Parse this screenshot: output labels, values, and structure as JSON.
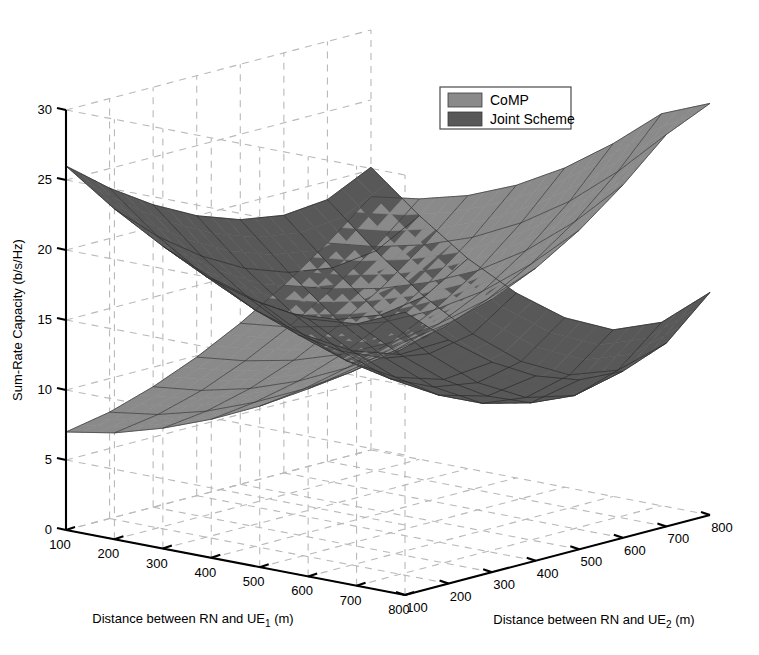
{
  "figure": {
    "width": 759,
    "height": 655,
    "background": "#ffffff"
  },
  "legend": {
    "position": "top-center-right",
    "items": [
      {
        "label": "CoMP",
        "color": "#8a8a8a"
      },
      {
        "label": "Joint Scheme",
        "color": "#585858"
      }
    ]
  },
  "axes": {
    "z": {
      "title": "Sum-Rate Capacity (b/s/Hz)",
      "ticks": [
        0,
        5,
        10,
        15,
        20,
        25,
        30
      ],
      "range": [
        0,
        30
      ]
    },
    "x": {
      "title_main": "Distance between RN and UE",
      "title_sub": "1",
      "title_unit": " (m)",
      "title_full": "Distance between RN and UE₁ (m)",
      "ticks": [
        100,
        200,
        300,
        400,
        500,
        600,
        700,
        800
      ],
      "range": [
        100,
        800
      ]
    },
    "y": {
      "title_main": "Distance between RN and UE",
      "title_sub": "2",
      "title_unit": " (m)",
      "title_full": "Distance between RN and UE₂ (m)",
      "ticks": [
        100,
        200,
        300,
        400,
        500,
        600,
        700,
        800
      ],
      "range": [
        100,
        800
      ]
    }
  },
  "chart_data": {
    "type": "surface",
    "title": "",
    "xlabel": "Distance between RN and UE₁ (m)",
    "ylabel": "Distance between RN and UE₂ (m)",
    "zlabel": "Sum-Rate Capacity (b/s/Hz)",
    "xlim": [
      100,
      800
    ],
    "ylim": [
      100,
      800
    ],
    "zlim": [
      0,
      30
    ],
    "grid": true,
    "legend_position": "top-right",
    "x": [
      100,
      200,
      300,
      400,
      500,
      600,
      700,
      800
    ],
    "y": [
      100,
      200,
      300,
      400,
      500,
      600,
      700,
      800
    ],
    "series": [
      {
        "name": "Joint Scheme",
        "color": "#585858",
        "edge_color": "#2d2d2d",
        "z": [
          [
            26.0,
            23.6,
            21.6,
            20.0,
            18.9,
            18.4,
            18.7,
            20.2
          ],
          [
            23.6,
            20.8,
            18.6,
            16.9,
            15.8,
            15.3,
            15.7,
            17.4
          ],
          [
            21.6,
            18.6,
            16.2,
            14.3,
            13.1,
            12.6,
            13.1,
            15.0
          ],
          [
            20.0,
            16.9,
            14.3,
            12.3,
            11.0,
            10.5,
            11.1,
            13.2
          ],
          [
            18.9,
            15.8,
            13.1,
            11.0,
            9.6,
            9.1,
            9.8,
            12.1
          ],
          [
            18.4,
            15.3,
            12.6,
            10.5,
            9.1,
            8.7,
            9.5,
            11.9
          ],
          [
            18.7,
            15.7,
            13.1,
            11.1,
            9.8,
            9.5,
            10.5,
            13.1
          ],
          [
            20.2,
            17.4,
            15.0,
            13.2,
            12.1,
            11.9,
            13.1,
            15.9
          ]
        ]
      },
      {
        "name": "CoMP",
        "color": "#8a8a8a",
        "edge_color": "#3d3d3d",
        "z": [
          [
            7.0,
            7.6,
            8.6,
            9.9,
            11.5,
            13.4,
            15.6,
            18.1
          ],
          [
            7.6,
            8.1,
            9.0,
            10.3,
            11.9,
            13.8,
            16.0,
            18.6
          ],
          [
            8.6,
            9.0,
            9.8,
            11.0,
            12.6,
            14.5,
            16.8,
            19.5
          ],
          [
            9.9,
            10.3,
            11.0,
            12.1,
            13.6,
            15.6,
            18.0,
            20.9
          ],
          [
            11.5,
            11.9,
            12.6,
            13.6,
            15.1,
            17.1,
            19.7,
            22.8
          ],
          [
            13.4,
            13.8,
            14.5,
            15.6,
            17.1,
            19.2,
            21.9,
            25.2
          ],
          [
            15.6,
            16.0,
            16.8,
            18.0,
            19.7,
            21.9,
            24.7,
            28.0
          ],
          [
            18.1,
            18.6,
            19.5,
            20.9,
            22.8,
            25.2,
            28.0,
            29.4
          ]
        ]
      }
    ]
  }
}
